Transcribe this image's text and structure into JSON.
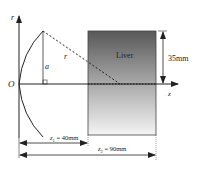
{
  "axes": {
    "vertical_label": "r",
    "horizontal_label": "z",
    "origin_label": "O"
  },
  "geometry": {
    "height_label": "a",
    "radius_label": "r"
  },
  "organ": {
    "label": "Liver",
    "gradient_top_color": "#585858",
    "gradient_mid_color": "#a8a8a8",
    "gradient_bottom_color": "#f2f2f2"
  },
  "dimensions": {
    "height": "35mm",
    "z1_symbol": "z",
    "z1_sub": "1",
    "z1_value": " = 40mm",
    "z2_symbol": "z",
    "z2_sub": "2",
    "z2_value": " = 90mm"
  }
}
